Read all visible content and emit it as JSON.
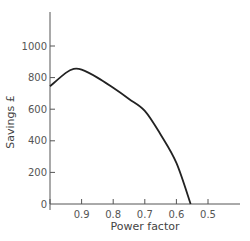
{
  "chart_data": {
    "type": "line",
    "title": "",
    "xlabel": "Power factor",
    "ylabel": "Savings £",
    "x_reversed": true,
    "xlim": [
      1.0,
      0.4
    ],
    "ylim": [
      0,
      1200
    ],
    "x_ticks": [
      1.0,
      0.9,
      0.8,
      0.7,
      0.6,
      0.5
    ],
    "x_tick_labels": [
      "1",
      "0.9",
      "0.8",
      "0.7",
      "0.6",
      "0.5"
    ],
    "y_ticks": [
      0,
      200,
      400,
      600,
      800,
      1000
    ],
    "y_tick_labels": [
      "0",
      "200",
      "400",
      "600",
      "800",
      "1000"
    ],
    "grid": false,
    "legend": null,
    "series": [
      {
        "name": "Savings",
        "x": [
          1.0,
          0.95,
          0.925,
          0.9,
          0.85,
          0.8,
          0.75,
          0.7,
          0.65,
          0.6,
          0.555
        ],
        "values": [
          745,
          830,
          855,
          850,
          800,
          735,
          665,
          590,
          440,
          260,
          0
        ]
      }
    ]
  }
}
